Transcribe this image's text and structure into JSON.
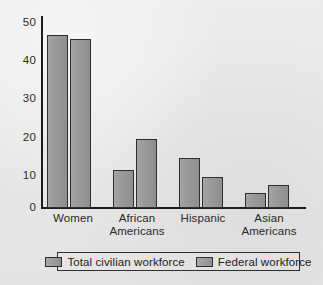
{
  "chart_data": {
    "type": "bar",
    "title": "",
    "subtitle": "",
    "xlabel": "",
    "ylabel": "",
    "ylim": [
      0,
      50
    ],
    "yticks": [
      0,
      10,
      20,
      30,
      40,
      50
    ],
    "ytick_labels": [
      "0",
      "10",
      "20",
      "30",
      "40",
      "50"
    ],
    "grid": false,
    "legend_position": "bottom",
    "categories": [
      "Women",
      "African Americans",
      "Hispanic",
      "Asian Americans"
    ],
    "category_lines": [
      [
        "Women"
      ],
      [
        "African",
        "Americans"
      ],
      [
        "Hispanic"
      ],
      [
        "Asian",
        "Americans"
      ]
    ],
    "series": [
      {
        "name": "Total civilian workforce",
        "color": "#969696",
        "values": [
          45,
          10,
          13,
          4
        ]
      },
      {
        "name": "Federal workforce",
        "color": "#969696",
        "values": [
          44,
          18,
          8,
          6
        ]
      }
    ]
  },
  "colors": {
    "background": "#e9e9e9",
    "bar_fill": "#969696",
    "bar_stroke": "#2f2f2f",
    "axis": "#1d1d1d",
    "text": "#2a2a2a"
  }
}
